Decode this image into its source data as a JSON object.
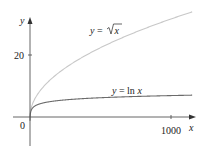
{
  "chart_data": {
    "type": "line",
    "title": "",
    "xlabel": "x",
    "ylabel": "y",
    "xlim": [
      0,
      1150
    ],
    "ylim": [
      -9,
      33
    ],
    "grid": false,
    "legend": "inline labels on curves",
    "x_ticks": [
      {
        "value": 1000,
        "label": "1000"
      }
    ],
    "y_ticks": [
      {
        "value": 20,
        "label": "20"
      }
    ],
    "origin_label": "0",
    "series": [
      {
        "name": "y = √x",
        "label_prefix": "y = ",
        "label_func": "√",
        "label_arg": "x",
        "color": "#c8c8c8",
        "x": [
          0,
          10,
          50,
          100,
          200,
          300,
          400,
          500,
          600,
          700,
          800,
          900,
          1000,
          1150
        ],
        "values": [
          0,
          3.16,
          7.07,
          10,
          14.14,
          17.32,
          20,
          22.36,
          24.49,
          26.46,
          28.28,
          30,
          31.62,
          33.91
        ]
      },
      {
        "name": "y = ln x",
        "label_prefix": "y = ",
        "label_func": "ln ",
        "label_arg": "x",
        "color": "#6b6b6b",
        "x": [
          1,
          5,
          10,
          50,
          100,
          200,
          300,
          500,
          700,
          1000,
          1150
        ],
        "values": [
          0,
          1.61,
          2.3,
          3.91,
          4.61,
          5.3,
          5.7,
          6.21,
          6.55,
          6.91,
          7.05
        ]
      }
    ]
  },
  "labels": {
    "y_axis": "y",
    "x_axis": "x",
    "origin": "0",
    "ytick_20": "20",
    "xtick_1000": "1000",
    "sqrt_prefix": "y = ",
    "sqrt_arg": "x",
    "ln_prefix": "y = ln ",
    "ln_arg": "x"
  }
}
